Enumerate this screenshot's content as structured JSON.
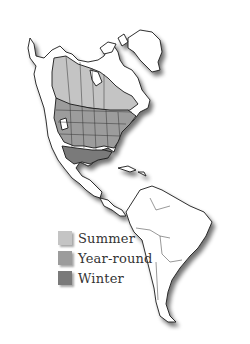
{
  "map": {
    "title": "",
    "region": "North and South America",
    "style": "grayscale range map with drop shadow"
  },
  "legend": {
    "items": [
      {
        "label": "Summer",
        "color": "#c4c4c4"
      },
      {
        "label": "Year-round",
        "color": "#9c9c9c"
      },
      {
        "label": "Winter",
        "color": "#7a7a7a"
      }
    ]
  },
  "colors": {
    "land": "#ffffff",
    "outline": "#1a1a1a",
    "summer": "#c4c4c4",
    "year_round": "#9c9c9c",
    "winter": "#7a7a7a",
    "shadow": "#888888"
  }
}
